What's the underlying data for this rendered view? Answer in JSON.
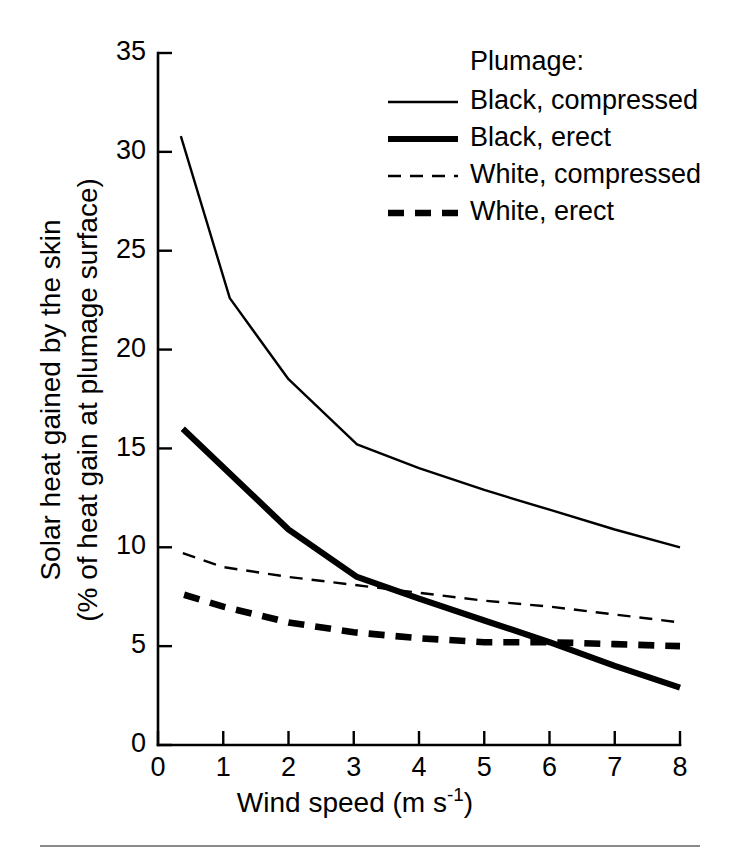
{
  "chart_data": {
    "type": "line",
    "title": "",
    "xlabel": "Wind speed (m s-1)",
    "xlabel_base": "Wind speed (m s",
    "xlabel_sup": "-1",
    "xlabel_tail": ")",
    "ylabel_line1": "Solar heat gained by the skin",
    "ylabel_line2": "(% of heat gain at plumage surface)",
    "xlim": [
      0,
      8
    ],
    "ylim": [
      0,
      35
    ],
    "xticks": [
      0,
      1,
      2,
      3,
      4,
      5,
      6,
      7,
      8
    ],
    "yticks": [
      0,
      5,
      10,
      15,
      20,
      25,
      30,
      35
    ],
    "xtick_labels": [
      "0",
      "1",
      "2",
      "3",
      "4",
      "5",
      "6",
      "7",
      "8"
    ],
    "ytick_labels": [
      "0",
      "5",
      "10",
      "15",
      "20",
      "25",
      "30",
      "35"
    ],
    "grid": false,
    "legend_position": "top-right",
    "legend_title": "Plumage:",
    "series": [
      {
        "name": "Black, compressed",
        "style": "thin-solid",
        "color": "#000000",
        "x": [
          0.35,
          1.1,
          2.0,
          3.05,
          4.0,
          5.0,
          6.0,
          7.0,
          8.0
        ],
        "y": [
          30.8,
          22.6,
          18.5,
          15.2,
          14.0,
          12.9,
          11.9,
          10.9,
          10.0
        ]
      },
      {
        "name": "Black, erect",
        "style": "thick-solid",
        "color": "#000000",
        "x": [
          0.38,
          2.0,
          3.05,
          4.0,
          5.0,
          6.0,
          7.0,
          8.0
        ],
        "y": [
          16.0,
          10.9,
          8.5,
          7.4,
          6.3,
          5.2,
          4.0,
          2.9
        ]
      },
      {
        "name": "White, compressed",
        "style": "thin-dashed",
        "color": "#000000",
        "x": [
          0.38,
          1.0,
          2.0,
          3.0,
          4.0,
          5.0,
          6.0,
          7.0,
          8.0
        ],
        "y": [
          9.7,
          9.0,
          8.5,
          8.1,
          7.7,
          7.3,
          7.0,
          6.6,
          6.2
        ]
      },
      {
        "name": "White, erect",
        "style": "thick-dashed",
        "color": "#000000",
        "x": [
          0.4,
          1.0,
          2.0,
          3.0,
          4.0,
          5.0,
          6.0,
          7.0,
          8.0
        ],
        "y": [
          7.6,
          7.0,
          6.2,
          5.7,
          5.4,
          5.2,
          5.2,
          5.1,
          5.0
        ]
      }
    ]
  },
  "legend": {
    "title": "Plumage:",
    "entries": [
      {
        "label": "Black, compressed",
        "style": "thin-solid"
      },
      {
        "label": "Black, erect",
        "style": "thick-solid"
      },
      {
        "label": "White, compressed",
        "style": "thin-dashed"
      },
      {
        "label": "White, erect",
        "style": "thick-dashed"
      }
    ]
  }
}
